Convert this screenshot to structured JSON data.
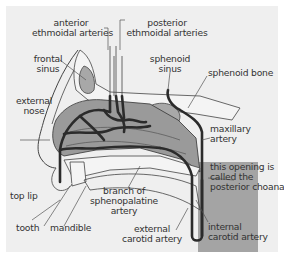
{
  "colors": {
    "background": "#efefef",
    "tissue": "#9a9a9a",
    "bone_fill": "#f4f4f4",
    "sinus_fill": "#a8a8a8",
    "artery": "#2b2b2b",
    "label_text": "#333333",
    "leader_line": "#555555"
  },
  "labels": {
    "anterior_ethmoidal": [
      "anterior",
      "ethmoidal arteries"
    ],
    "posterior_ethmoidal": [
      "posterior",
      "ethmoidal arteries"
    ],
    "frontal_sinus": [
      "frontal",
      "sinus"
    ],
    "sphenoid_sinus": [
      "sphenoid",
      "sinus"
    ],
    "sphenoid_bone": [
      "sphenoid bone"
    ],
    "external_nose": [
      "external",
      "nose"
    ],
    "maxillary_artery": [
      "maxillary",
      "artery"
    ],
    "posterior_choana": [
      "this opening is",
      "called the",
      "posterior choana"
    ],
    "top_lip": [
      "top lip"
    ],
    "branch_sphenopalatine": [
      "branch of",
      "sphenopalatine",
      "artery"
    ],
    "tooth": [
      "tooth"
    ],
    "mandible": [
      "mandible"
    ],
    "external_carotid": [
      "external",
      "carotid artery"
    ],
    "internal_carotid": [
      "internal",
      "carotid artery"
    ]
  }
}
